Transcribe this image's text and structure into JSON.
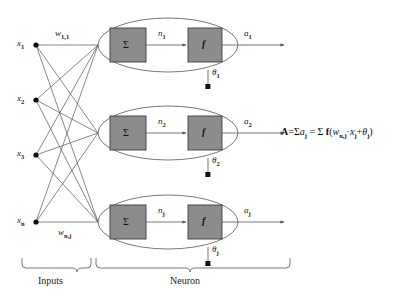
{
  "diagram": {
    "colors": {
      "stroke": "#555555",
      "box_fill": "#8c8c8c",
      "box_stroke": "#3d3d3d",
      "text": "#111111",
      "background": "#ffffff"
    },
    "inputs": {
      "group_label": "Inputs",
      "nodes": [
        {
          "label": "x",
          "sub": "1"
        },
        {
          "label": "x",
          "sub": "2"
        },
        {
          "label": "x",
          "sub": "3"
        },
        {
          "label": "x",
          "sub": "n"
        }
      ]
    },
    "weights": [
      {
        "label": "w",
        "sub": "1,1"
      },
      {
        "label": "w",
        "sub": "n,j"
      }
    ],
    "neuron": {
      "group_label": "Neuron",
      "sum_symbol": "Σ",
      "function_symbol": "f",
      "rows": [
        {
          "net_label": "n",
          "net_sub": "1",
          "out_label": "a",
          "out_sub": "1",
          "bias_label": "θ",
          "bias_sub": "1"
        },
        {
          "net_label": "n",
          "net_sub": "2",
          "out_label": "a",
          "out_sub": "2",
          "bias_label": "θ",
          "bias_sub": "2"
        },
        {
          "net_label": "n",
          "net_sub": "j",
          "out_label": "a",
          "out_sub": "j",
          "bias_label": "θ",
          "bias_sub": "j"
        }
      ]
    },
    "formula": {
      "full_text": "A=Σ aⱼ = Σ f(wₙ,ⱼ·xⱼ+θⱼ)",
      "lhs_symbol": "A",
      "equals": "=",
      "sigma": "Σ",
      "activation_var": "a",
      "activation_sub": "j",
      "function_symbol": "f",
      "weight_var": "w",
      "weight_sub": "n,j",
      "multiply": "·",
      "input_var": "x",
      "input_sub": "j",
      "plus": "+",
      "bias_var": "θ",
      "bias_sub": "j",
      "open_paren": "(",
      "close_paren": ")"
    }
  }
}
